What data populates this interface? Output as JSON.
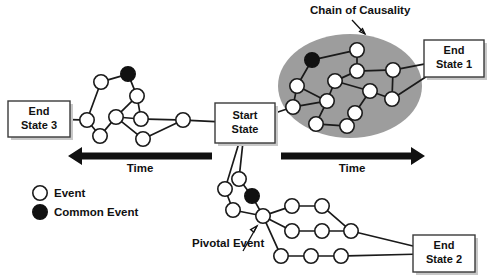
{
  "diagram": {
    "title_visible": false,
    "background_color": "#ffffff",
    "ink_color": "#111111",
    "ellipse_fill": "#9d9d9d",
    "box_fill": "#ffffff",
    "box_stroke": "#3a3a3a",
    "box_shadow": "#c8c8c8"
  },
  "boxes": [
    {
      "id": "end-state-3",
      "line1": "End",
      "line2": "State 3",
      "x": 8,
      "y": 101,
      "w": 62,
      "h": 36
    },
    {
      "id": "start-state",
      "line1": "Start",
      "line2": "State",
      "x": 215,
      "y": 103,
      "w": 60,
      "h": 40
    },
    {
      "id": "end-state-1",
      "line1": "End",
      "line2": "State 1",
      "x": 424,
      "y": 40,
      "w": 60,
      "h": 37
    },
    {
      "id": "end-state-2",
      "line1": "End",
      "line2": "State 2",
      "x": 413,
      "y": 235,
      "w": 62,
      "h": 37
    }
  ],
  "annotations": [
    {
      "id": "chain-of-causality",
      "text": "Chain of Causality",
      "x": 310,
      "y": 14
    },
    {
      "id": "pivotal-event",
      "text": "Pivotal Event",
      "x": 192,
      "y": 247
    }
  ],
  "time_axes": [
    {
      "id": "time-left",
      "label": "Time",
      "direction": "left",
      "x1": 68,
      "x2": 212,
      "y": 156,
      "label_x": 140,
      "label_y": 172
    },
    {
      "id": "time-right",
      "label": "Time",
      "direction": "right",
      "x1": 281,
      "x2": 425,
      "y": 156,
      "label_x": 352,
      "label_y": 172
    }
  ],
  "legend": {
    "items": [
      {
        "id": "legend-event",
        "label": "Event",
        "marker": "open-circle",
        "cx": 40,
        "cy": 193
      },
      {
        "id": "legend-common-event",
        "label": "Common Event",
        "marker": "filled-circle",
        "cx": 40,
        "cy": 212
      }
    ]
  },
  "chart_data": {
    "type": "diagram",
    "node_types": [
      "Event",
      "Common Event"
    ],
    "clusters": [
      {
        "name": "left-branch",
        "end_state": "End State 3",
        "nodes": [
          {
            "id": "L1",
            "x": 87,
            "y": 120,
            "type": "event"
          },
          {
            "id": "L2",
            "x": 100,
            "y": 136,
            "type": "event"
          },
          {
            "id": "L3",
            "x": 101,
            "y": 82,
            "type": "event"
          },
          {
            "id": "L4",
            "x": 128,
            "y": 74,
            "type": "common"
          },
          {
            "id": "L5",
            "x": 137,
            "y": 96,
            "type": "event"
          },
          {
            "id": "L6",
            "x": 116,
            "y": 117,
            "type": "event"
          },
          {
            "id": "L7",
            "x": 141,
            "y": 119,
            "type": "event"
          },
          {
            "id": "L8",
            "x": 143,
            "y": 139,
            "type": "event"
          },
          {
            "id": "L9",
            "x": 183,
            "y": 120,
            "type": "event"
          }
        ],
        "edges": [
          [
            "box-end-state-3",
            "L1"
          ],
          [
            "L1",
            "L3"
          ],
          [
            "L3",
            "L4"
          ],
          [
            "L4",
            "L5"
          ],
          [
            "L5",
            "L7"
          ],
          [
            "L5",
            "L6"
          ],
          [
            "L1",
            "L2"
          ],
          [
            "L2",
            "L6"
          ],
          [
            "L6",
            "L7"
          ],
          [
            "L6",
            "L8"
          ],
          [
            "L8",
            "L9"
          ],
          [
            "L7",
            "L9"
          ],
          [
            "L9",
            "box-start-state"
          ]
        ]
      },
      {
        "name": "chain-of-causality",
        "end_state": "End State 1",
        "ellipse": {
          "cx": 350,
          "cy": 86,
          "rx": 72,
          "ry": 52
        },
        "nodes": [
          {
            "id": "C1",
            "x": 312,
            "y": 60,
            "type": "common"
          },
          {
            "id": "C2",
            "x": 357,
            "y": 50,
            "type": "event"
          },
          {
            "id": "C3",
            "x": 297,
            "y": 86,
            "type": "event"
          },
          {
            "id": "C4",
            "x": 335,
            "y": 81,
            "type": "event"
          },
          {
            "id": "C5",
            "x": 357,
            "y": 71,
            "type": "event"
          },
          {
            "id": "C6",
            "x": 393,
            "y": 70,
            "type": "event"
          },
          {
            "id": "C7",
            "x": 370,
            "y": 91,
            "type": "event"
          },
          {
            "id": "C8",
            "x": 327,
            "y": 101,
            "type": "event"
          },
          {
            "id": "C9",
            "x": 293,
            "y": 107,
            "type": "event"
          },
          {
            "id": "C10",
            "x": 355,
            "y": 113,
            "type": "event"
          },
          {
            "id": "C11",
            "x": 392,
            "y": 99,
            "type": "event"
          },
          {
            "id": "C12",
            "x": 316,
            "y": 124,
            "type": "event"
          },
          {
            "id": "C13",
            "x": 347,
            "y": 126,
            "type": "event"
          }
        ],
        "edges": [
          [
            "box-start-state",
            "C9"
          ],
          [
            "C9",
            "C3"
          ],
          [
            "C3",
            "C1"
          ],
          [
            "C1",
            "C2"
          ],
          [
            "C2",
            "C5"
          ],
          [
            "C5",
            "C6"
          ],
          [
            "C5",
            "C4"
          ],
          [
            "C4",
            "C8"
          ],
          [
            "C3",
            "C8"
          ],
          [
            "C9",
            "C8"
          ],
          [
            "C8",
            "C12"
          ],
          [
            "C12",
            "C13"
          ],
          [
            "C13",
            "C10"
          ],
          [
            "C10",
            "C7"
          ],
          [
            "C7",
            "C11"
          ],
          [
            "C11",
            "C6"
          ],
          [
            "C6",
            "box-end-state-1"
          ],
          [
            "C11",
            "box-end-state-1"
          ],
          [
            "C7",
            "C4"
          ]
        ]
      },
      {
        "name": "bottom-branch",
        "end_state": "End State 2",
        "pivotal_node": "B7",
        "nodes": [
          {
            "id": "B1",
            "x": 239,
            "y": 179,
            "type": "event"
          },
          {
            "id": "B2",
            "x": 252,
            "y": 196,
            "type": "common"
          },
          {
            "id": "B3",
            "x": 225,
            "y": 189,
            "type": "event"
          },
          {
            "id": "B4",
            "x": 233,
            "y": 210,
            "type": "event"
          },
          {
            "id": "B7",
            "x": 263,
            "y": 216,
            "type": "event"
          },
          {
            "id": "B8",
            "x": 292,
            "y": 206,
            "type": "event"
          },
          {
            "id": "B9",
            "x": 322,
            "y": 206,
            "type": "event"
          },
          {
            "id": "B10",
            "x": 292,
            "y": 231,
            "type": "event"
          },
          {
            "id": "B11",
            "x": 322,
            "y": 231,
            "type": "event"
          },
          {
            "id": "B12",
            "x": 351,
            "y": 231,
            "type": "event"
          },
          {
            "id": "B13",
            "x": 281,
            "y": 256,
            "type": "event"
          },
          {
            "id": "B14",
            "x": 311,
            "y": 256,
            "type": "event"
          },
          {
            "id": "B15",
            "x": 341,
            "y": 256,
            "type": "event"
          }
        ],
        "edges": [
          [
            "box-start-state",
            "B3"
          ],
          [
            "box-start-state",
            "B1"
          ],
          [
            "B1",
            "B2"
          ],
          [
            "B2",
            "B7"
          ],
          [
            "B3",
            "B4"
          ],
          [
            "B4",
            "B7"
          ],
          [
            "B7",
            "B8"
          ],
          [
            "B8",
            "B9"
          ],
          [
            "B9",
            "B12"
          ],
          [
            "B7",
            "B10"
          ],
          [
            "B10",
            "B11"
          ],
          [
            "B11",
            "B12"
          ],
          [
            "B7",
            "B13"
          ],
          [
            "B13",
            "B14"
          ],
          [
            "B14",
            "B15"
          ],
          [
            "B12",
            "box-end-state-2"
          ],
          [
            "B15",
            "box-end-state-2"
          ]
        ]
      }
    ]
  }
}
